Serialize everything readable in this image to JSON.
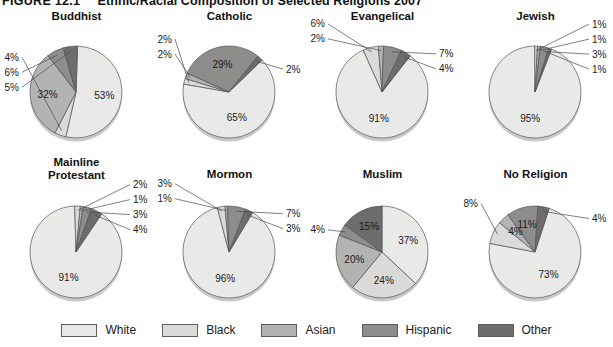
{
  "figure": {
    "number": "FIGURE 12.1",
    "title": "Ethnic/Racial Composition of Selected Religions 2007"
  },
  "legend": {
    "items": [
      {
        "label": "White",
        "color": "#e9e9e7"
      },
      {
        "label": "Black",
        "color": "#dadad8"
      },
      {
        "label": "Asian",
        "color": "#b3b3b1"
      },
      {
        "label": "Hispanic",
        "color": "#8d8d8b"
      },
      {
        "label": "Other",
        "color": "#6d6d6b"
      }
    ]
  },
  "chart_data": {
    "type": "pie",
    "title": "Ethnic/Racial Composition of Selected Religions 2007",
    "categories": [
      "White",
      "Black",
      "Asian",
      "Hispanic",
      "Other"
    ],
    "colors": [
      "#e9e9e7",
      "#dadad8",
      "#b3b3b1",
      "#8d8d8b",
      "#6d6d6b"
    ],
    "legend_position": "bottom",
    "units": "percent",
    "charts": [
      {
        "name": "Buddhist",
        "title": "Buddhist",
        "values": [
          53,
          4,
          32,
          6,
          5
        ],
        "labels": [
          "53%",
          "4%",
          "32%",
          "6%",
          "5%"
        ]
      },
      {
        "name": "Catholic",
        "title": "Catholic",
        "values": [
          65,
          2,
          2,
          29,
          2
        ],
        "labels": [
          "65%",
          "2%",
          "2%",
          "29%",
          "2%"
        ]
      },
      {
        "name": "Evangelical",
        "title": "Evangelical",
        "values": [
          91,
          6,
          2,
          7,
          4
        ],
        "labels": [
          "91%",
          "6%",
          "2%",
          "7%",
          "4%"
        ]
      },
      {
        "name": "Jewish",
        "title": "Jewish",
        "values": [
          95,
          1,
          1,
          3,
          1
        ],
        "labels": [
          "95%",
          "1%",
          "1%",
          "3%",
          "1%"
        ]
      },
      {
        "name": "Mainline Protestant",
        "title": "Mainline\nProtestant",
        "values": [
          91,
          2,
          1,
          3,
          4
        ],
        "labels": [
          "91%",
          "2%",
          "1%",
          "3%",
          "4%"
        ]
      },
      {
        "name": "Mormon",
        "title": "Mormon",
        "values": [
          96,
          3,
          1,
          7,
          3
        ],
        "labels": [
          "96%",
          "3%",
          "1%",
          "7%",
          "3%"
        ]
      },
      {
        "name": "Muslim",
        "title": "Muslim",
        "values": [
          37,
          24,
          20,
          4,
          15
        ],
        "labels": [
          "37%",
          "24%",
          "20%",
          "4%",
          "15%"
        ]
      },
      {
        "name": "No Religion",
        "title": "No Religion",
        "values": [
          73,
          8,
          4,
          11,
          4
        ],
        "labels": [
          "73%",
          "8%",
          "4%",
          "11%",
          "4%"
        ]
      }
    ]
  }
}
